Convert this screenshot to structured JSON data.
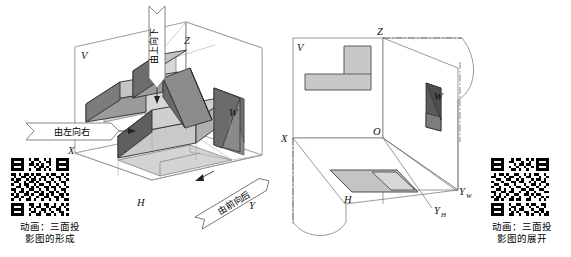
{
  "figure": {
    "panels": [
      {
        "id": "left",
        "name": "formation-of-three-view-projection",
        "caption_line1": "动画：三面投",
        "caption_line2": "影图的形成",
        "axis_labels": {
          "v": "V",
          "w": "W",
          "h": "H",
          "x": "X",
          "y": "Y",
          "z": "Z"
        },
        "direction_arrows": [
          {
            "name": "top-down-arrow",
            "label": "由上向下",
            "orientation": "vertical-down"
          },
          {
            "name": "left-right-arrow",
            "label": "由左向右",
            "orientation": "horizontal-right"
          },
          {
            "name": "front-back-arrow",
            "label": "由前向后",
            "orientation": "diagonal-back"
          }
        ],
        "qr_name": "qr-code-formation"
      },
      {
        "id": "right",
        "name": "unfolding-of-three-view-projection",
        "caption_line1": "动画：三面投",
        "caption_line2": "影图的展开",
        "axis_labels": {
          "v": "V",
          "w": "W",
          "h": "H",
          "x": "X",
          "o": "O",
          "z": "Z",
          "yw": "Y",
          "yw_sub": "W",
          "yh": "Y",
          "yh_sub": "H"
        },
        "qr_name": "qr-code-unfolding"
      }
    ],
    "colors": {
      "line": "#4a4a4a",
      "thin_line": "#8a8a8a",
      "face_light": "#d8d8d8",
      "face_mid": "#b9b9b9",
      "face_dark": "#8e8e8e",
      "face_darker": "#707070",
      "outline": "#2a2a2a",
      "background": "#ffffff",
      "text": "#000000"
    }
  }
}
